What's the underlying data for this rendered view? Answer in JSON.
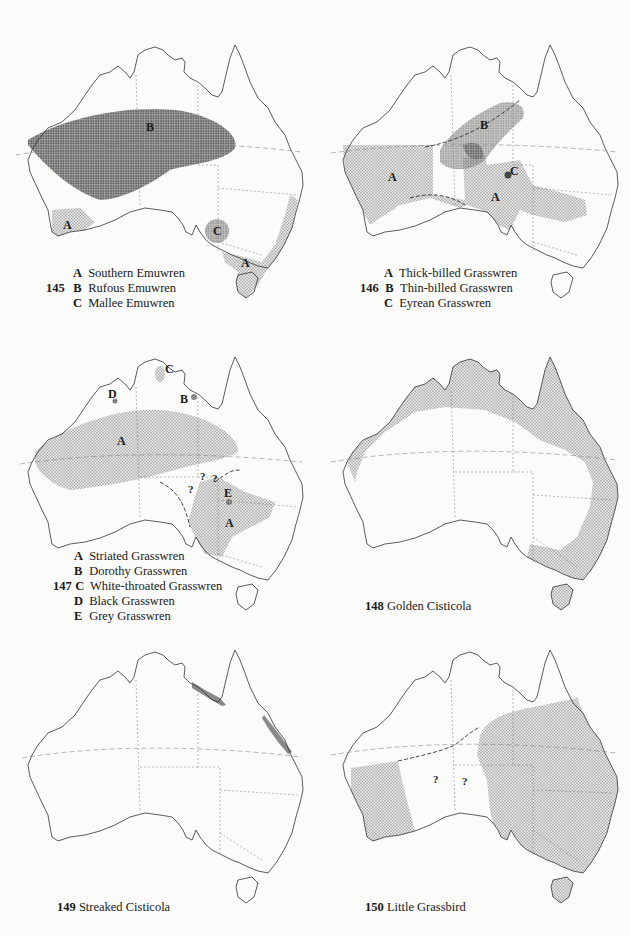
{
  "maps": [
    {
      "id": "145",
      "number": "145",
      "legend": [
        {
          "letter": "A",
          "name": "Southern Emuwren"
        },
        {
          "letter": "B",
          "name": "Rufous Emuwren"
        },
        {
          "letter": "C",
          "name": "Mallee Emuwren"
        }
      ],
      "labels": [
        "B",
        "A",
        "C",
        "A"
      ]
    },
    {
      "id": "146",
      "number": "146",
      "legend": [
        {
          "letter": "A",
          "name": "Thick-billed Grasswren"
        },
        {
          "letter": "B",
          "name": "Thin-billed Grasswren"
        },
        {
          "letter": "C",
          "name": "Eyrean Grasswren"
        }
      ],
      "labels": [
        "B",
        "A",
        "C",
        "A"
      ]
    },
    {
      "id": "147",
      "number": "147",
      "legend": [
        {
          "letter": "A",
          "name": "Striated Grasswren"
        },
        {
          "letter": "B",
          "name": "Dorothy Grasswren"
        },
        {
          "letter": "C",
          "name": "White-throated Grasswren"
        },
        {
          "letter": "D",
          "name": "Black Grasswren"
        },
        {
          "letter": "E",
          "name": "Grey Grasswren"
        }
      ],
      "labels": [
        "C",
        "D",
        "B",
        "A",
        "E",
        "A"
      ],
      "question_marks": [
        "?",
        "?",
        "?"
      ]
    },
    {
      "id": "148",
      "number": "148",
      "title": "Golden Cisticola"
    },
    {
      "id": "149",
      "number": "149",
      "title": "Streaked Cisticola"
    },
    {
      "id": "150",
      "number": "150",
      "title": "Little Grassbird",
      "question_marks": [
        "?",
        "?"
      ]
    }
  ],
  "colors": {
    "outline": "#333333",
    "light_stipple": "#b9b9b9",
    "dark_stipple": "#7d7d7d",
    "background": "#fbfbf9"
  }
}
